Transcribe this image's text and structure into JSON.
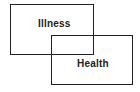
{
  "diagram": {
    "type": "overlapping-rectangles",
    "boxes": [
      {
        "label": "Illness"
      },
      {
        "label": "Health"
      }
    ],
    "colors": {
      "stroke": "#222222",
      "text": "#222222",
      "background": "#ffffff"
    }
  }
}
